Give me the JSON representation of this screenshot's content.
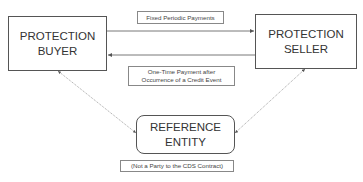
{
  "diagram": {
    "nodes": {
      "buyer": {
        "label": "PROTECTION\nBUYER"
      },
      "seller": {
        "label": "PROTECTION\nSELLER"
      },
      "reference": {
        "label": "REFERENCE\nENTITY",
        "shape": "rounded-rectangle"
      }
    },
    "edges": [
      {
        "from": "buyer",
        "to": "seller",
        "label": "Fixed Periodic Payments",
        "style": "solid"
      },
      {
        "from": "seller",
        "to": "buyer",
        "label": "One-Time Payment after\nOccurrence of a Credit Event",
        "style": "solid"
      },
      {
        "from": "reference",
        "to": "buyer",
        "style": "dotted",
        "bidirectional": true
      },
      {
        "from": "reference",
        "to": "seller",
        "style": "dotted",
        "bidirectional": true
      }
    ],
    "notes": {
      "reference_note": "(Not a Party to the CDS Contract)"
    },
    "colors": {
      "line": "#555555",
      "text": "#333333"
    }
  }
}
